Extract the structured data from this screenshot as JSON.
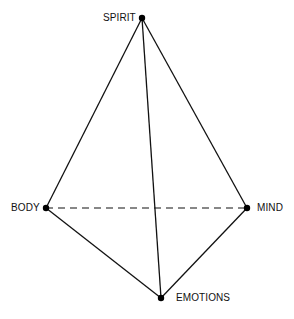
{
  "diagram": {
    "nodes": [
      {
        "id": "spirit",
        "label": "SPIRIT",
        "x": 142,
        "y": 18
      },
      {
        "id": "body",
        "label": "BODY",
        "x": 46,
        "y": 208
      },
      {
        "id": "mind",
        "label": "MIND",
        "x": 247,
        "y": 208
      },
      {
        "id": "emotions",
        "label": "EMOTIONS",
        "x": 161,
        "y": 298
      }
    ],
    "edges": [
      {
        "from": "spirit",
        "to": "body",
        "style": "solid"
      },
      {
        "from": "spirit",
        "to": "mind",
        "style": "solid"
      },
      {
        "from": "spirit",
        "to": "emotions",
        "style": "solid"
      },
      {
        "from": "body",
        "to": "emotions",
        "style": "solid"
      },
      {
        "from": "mind",
        "to": "emotions",
        "style": "solid"
      },
      {
        "from": "body",
        "to": "mind",
        "style": "dashed"
      }
    ],
    "colors": {
      "line": "#111111",
      "dot": "#000000",
      "background": "#ffffff"
    }
  }
}
